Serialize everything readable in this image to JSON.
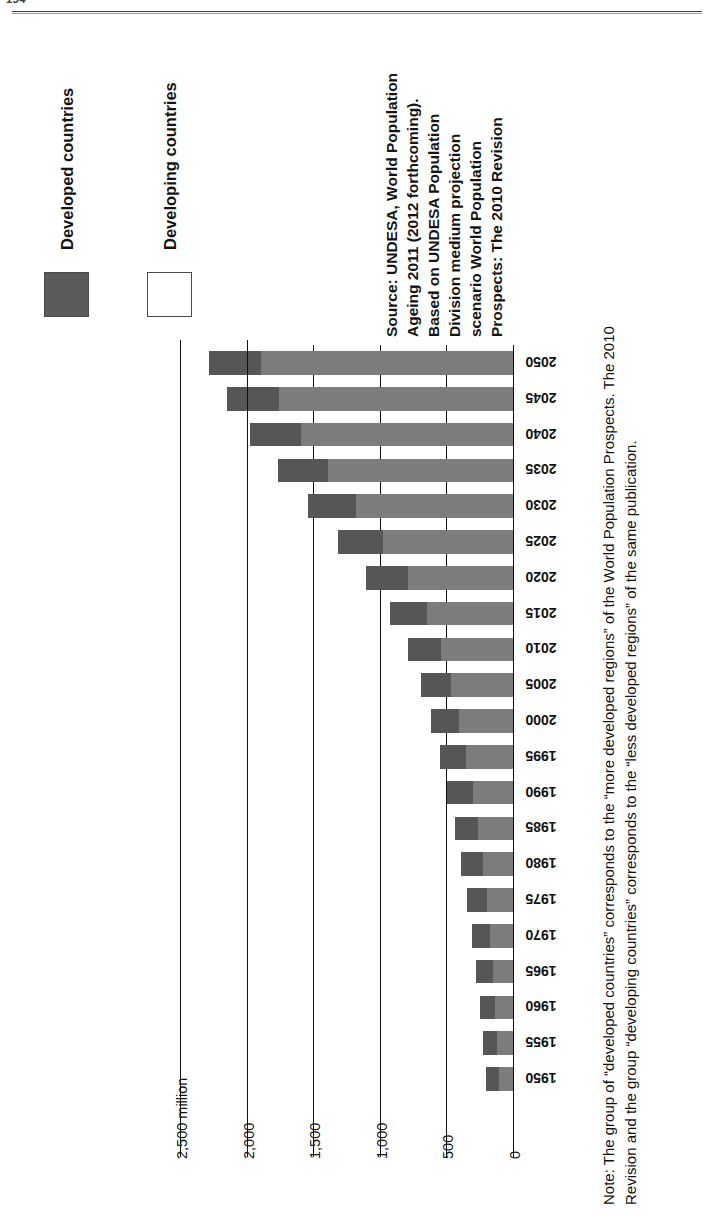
{
  "page": {
    "folio": "154",
    "header_rule": "horizontal-rule"
  },
  "legend": {
    "items": [
      {
        "label": "Developed countries",
        "swatch": "dark-gray-filled",
        "color": "#5b5b5b"
      },
      {
        "label": "Developing countries",
        "swatch": "white-outlined",
        "color": "#ffffff"
      }
    ]
  },
  "source": {
    "lines": [
      "Source: UNDESA, World Population",
      "Ageing 2011 (2012 forthcoming).",
      "Based on UNDESA Population",
      "Division medium projection",
      "scenario World Population",
      "Prospects: The 2010 Revision"
    ]
  },
  "note": {
    "lines": [
      "Note: The group of “developed countries” corresponds to the “more developed regions” of the World Population Prospects. The 2010",
      "Revision and the group “developing countries” corresponds to the “less developed regions” of the same publication."
    ]
  },
  "chart_data": {
    "type": "bar",
    "orientation": "horizontal-rotated",
    "stacked": true,
    "title": "",
    "xlabel": "",
    "ylabel": "",
    "axis_unit_label": "2,500 million",
    "tick_labels": [
      "2,500 million",
      "2,000",
      "1,500",
      "1,000",
      "500",
      "0"
    ],
    "tick_values": [
      2500,
      2000,
      1500,
      1000,
      500,
      0
    ],
    "xlim": [
      0,
      2500
    ],
    "grid": true,
    "legend_position": "top-left",
    "categories": [
      "1950",
      "1955",
      "1960",
      "1965",
      "1970",
      "1975",
      "1980",
      "1985",
      "1990",
      "1995",
      "2000",
      "2005",
      "2010",
      "2015",
      "2020",
      "2025",
      "2030",
      "2035",
      "2040",
      "2045",
      "2050"
    ],
    "series": [
      {
        "name": "Developing countries",
        "color": "#7c7c7c",
        "values": [
          108,
          120,
          135,
          152,
          172,
          196,
          226,
          262,
          303,
          350,
          404,
          466,
          540,
          645,
          790,
          975,
          1180,
          1390,
          1590,
          1760,
          1890
        ]
      },
      {
        "name": "Developed countries",
        "color": "#565656",
        "values": [
          95,
          105,
          115,
          126,
          138,
          151,
          164,
          177,
          190,
          201,
          212,
          227,
          251,
          281,
          311,
          337,
          357,
          371,
          381,
          389,
          394
        ]
      }
    ],
    "totals": [
      203,
      225,
      250,
      278,
      310,
      347,
      390,
      439,
      493,
      551,
      616,
      693,
      791,
      926,
      1101,
      1312,
      1537,
      1761,
      1971,
      2149,
      2284
    ]
  }
}
